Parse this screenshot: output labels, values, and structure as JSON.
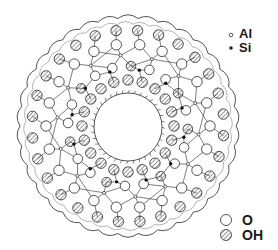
{
  "figure": {
    "type": "cross-section",
    "center": [
      128,
      126
    ],
    "outer_radius": 111,
    "inner_radius": 34,
    "rings": {
      "outer_oh": {
        "radius": 96,
        "count": 28,
        "atom": "OH"
      },
      "outer_o": {
        "radius": 82,
        "count": 22,
        "atom": "O"
      },
      "metal_al": {
        "radius": 71,
        "count": 14,
        "atom": "Al"
      },
      "mid_o": {
        "radius": 60,
        "count": 20,
        "atom": "O"
      },
      "si": {
        "radius": 62,
        "count": 12,
        "atom": "Si"
      },
      "inner_oh": {
        "radius": 46,
        "count": 20,
        "atom": "OH"
      }
    }
  },
  "legend": {
    "atoms": [
      {
        "symbol": "open-dot",
        "label": "Al"
      },
      {
        "symbol": "filled-dot",
        "label": "Si"
      },
      {
        "symbol": "open-circle",
        "label": "O"
      },
      {
        "symbol": "hatched-circle",
        "label": "OH"
      }
    ]
  },
  "colors": {
    "stroke": "#2a2a2a",
    "background": "#ffffff"
  }
}
